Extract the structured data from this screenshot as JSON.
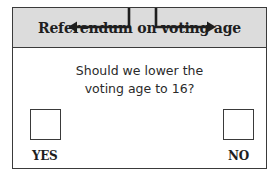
{
  "ballot": {
    "title": "Referendum on voting age",
    "question_lines": [
      "Should we lower the",
      "voting age to 16?"
    ],
    "options": [
      {
        "label": "YES",
        "checked": false,
        "arrow_direction": "left"
      },
      {
        "label": "NO",
        "checked": false,
        "arrow_direction": "right"
      }
    ]
  },
  "colors": {
    "header_background": "#dcdcdc",
    "border": "#3a3a3a",
    "text": "#1e1e1e",
    "background": "#ffffff"
  }
}
